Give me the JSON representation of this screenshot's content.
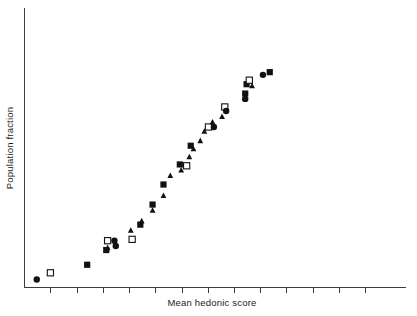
{
  "figure": {
    "title": "",
    "background_color": "#ffffff",
    "marker_color": "#111111",
    "axis_color": "#3b3b3b"
  },
  "chart_data": {
    "type": "scatter",
    "title": "",
    "subtitle": "",
    "xlabel": "Mean hedonic score",
    "ylabel": "Population fraction",
    "xlim": [
      0,
      14
    ],
    "ylim": [
      0,
      1
    ],
    "grid": false,
    "legend": "none",
    "x_tick_labels": [],
    "y_tick_labels": [],
    "x_tick_count": 13,
    "annotations": [],
    "series": [
      {
        "name": "filled-square",
        "marker": "square-filled",
        "points": [
          {
            "x": 2.3,
            "y": 0.085
          },
          {
            "x": 3.0,
            "y": 0.14
          },
          {
            "x": 4.25,
            "y": 0.235
          },
          {
            "x": 4.7,
            "y": 0.31
          },
          {
            "x": 5.1,
            "y": 0.385
          },
          {
            "x": 5.7,
            "y": 0.46
          },
          {
            "x": 6.1,
            "y": 0.53
          },
          {
            "x": 8.1,
            "y": 0.725
          },
          {
            "x": 8.15,
            "y": 0.76
          },
          {
            "x": 9.0,
            "y": 0.805
          }
        ]
      },
      {
        "name": "open-square",
        "marker": "square-open",
        "points": [
          {
            "x": 0.95,
            "y": 0.055
          },
          {
            "x": 3.05,
            "y": 0.175
          },
          {
            "x": 3.95,
            "y": 0.18
          },
          {
            "x": 5.95,
            "y": 0.455
          },
          {
            "x": 6.75,
            "y": 0.6
          },
          {
            "x": 7.35,
            "y": 0.675
          },
          {
            "x": 8.25,
            "y": 0.775
          }
        ]
      },
      {
        "name": "filled-circle",
        "marker": "circle-filled",
        "points": [
          {
            "x": 0.45,
            "y": 0.03
          },
          {
            "x": 3.3,
            "y": 0.175
          },
          {
            "x": 3.35,
            "y": 0.155
          },
          {
            "x": 6.95,
            "y": 0.6
          },
          {
            "x": 7.4,
            "y": 0.66
          },
          {
            "x": 8.1,
            "y": 0.705
          },
          {
            "x": 8.75,
            "y": 0.795
          }
        ]
      },
      {
        "name": "filled-triangle",
        "marker": "triangle-filled",
        "points": [
          {
            "x": 3.05,
            "y": 0.15
          },
          {
            "x": 3.9,
            "y": 0.215
          },
          {
            "x": 4.3,
            "y": 0.25
          },
          {
            "x": 4.7,
            "y": 0.29
          },
          {
            "x": 5.1,
            "y": 0.345
          },
          {
            "x": 5.35,
            "y": 0.42
          },
          {
            "x": 5.75,
            "y": 0.44
          },
          {
            "x": 6.05,
            "y": 0.49
          },
          {
            "x": 6.2,
            "y": 0.52
          },
          {
            "x": 6.45,
            "y": 0.55
          },
          {
            "x": 6.6,
            "y": 0.585
          },
          {
            "x": 6.9,
            "y": 0.62
          },
          {
            "x": 7.25,
            "y": 0.64
          },
          {
            "x": 8.35,
            "y": 0.755
          }
        ]
      }
    ]
  }
}
